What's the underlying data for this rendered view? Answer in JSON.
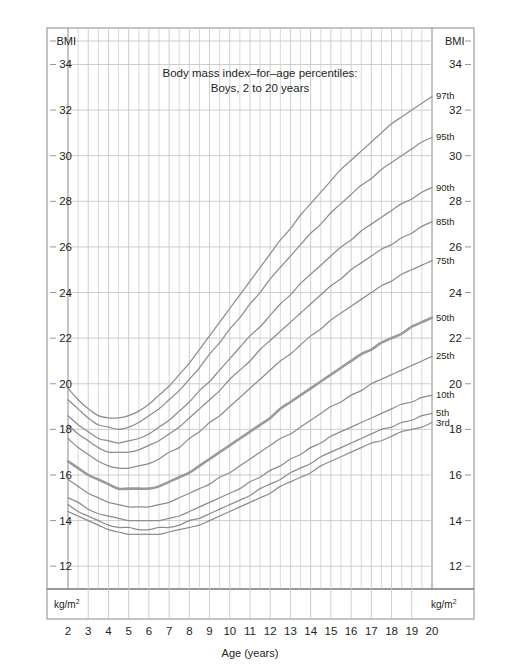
{
  "chart_data": {
    "type": "line",
    "title": "Body mass index–for–age percentiles:",
    "subtitle": "Boys, 2 to 20 years",
    "xlabel": "Age (years)",
    "ylabel": "BMI",
    "unit": "kg/m",
    "unit_sup": "2",
    "xlim": [
      2,
      20
    ],
    "ylim": [
      11,
      35.6
    ],
    "grid": true,
    "legend_position": "right-inline",
    "x_ticks": [
      2,
      3,
      4,
      5,
      6,
      7,
      8,
      9,
      10,
      11,
      12,
      13,
      14,
      15,
      16,
      17,
      18,
      19,
      20
    ],
    "x_minor_step": 0.5,
    "y_ticks": [
      12,
      14,
      16,
      18,
      20,
      22,
      24,
      26,
      28,
      30,
      32,
      34
    ],
    "y_axis_top_label": "BMI",
    "x": [
      2,
      2.5,
      3,
      3.5,
      4,
      4.5,
      5,
      5.5,
      6,
      6.5,
      7,
      7.5,
      8,
      8.5,
      9,
      9.5,
      10,
      10.5,
      11,
      11.5,
      12,
      12.5,
      13,
      13.5,
      14,
      14.5,
      15,
      15.5,
      16,
      16.5,
      17,
      17.5,
      18,
      18.5,
      19,
      19.5,
      20
    ],
    "series": [
      {
        "name": "97th",
        "label": "97th",
        "bold": false,
        "values": [
          19.8,
          19.3,
          18.9,
          18.6,
          18.5,
          18.5,
          18.6,
          18.8,
          19.1,
          19.5,
          19.9,
          20.4,
          20.9,
          21.5,
          22.1,
          22.7,
          23.3,
          23.9,
          24.5,
          25.1,
          25.7,
          26.3,
          26.8,
          27.4,
          27.9,
          28.4,
          28.9,
          29.4,
          29.8,
          30.2,
          30.6,
          31.0,
          31.4,
          31.7,
          32.0,
          32.3,
          32.6
        ]
      },
      {
        "name": "95th",
        "label": "95th",
        "bold": false,
        "values": [
          19.3,
          18.9,
          18.5,
          18.2,
          18.1,
          18.0,
          18.1,
          18.3,
          18.6,
          18.9,
          19.3,
          19.7,
          20.2,
          20.7,
          21.3,
          21.8,
          22.4,
          22.9,
          23.5,
          24.0,
          24.6,
          25.1,
          25.6,
          26.1,
          26.6,
          27.0,
          27.5,
          27.9,
          28.3,
          28.7,
          29.0,
          29.4,
          29.7,
          30.0,
          30.3,
          30.6,
          30.8
        ]
      },
      {
        "name": "90th",
        "label": "90th",
        "bold": false,
        "values": [
          18.6,
          18.2,
          17.9,
          17.6,
          17.5,
          17.4,
          17.5,
          17.6,
          17.8,
          18.1,
          18.4,
          18.8,
          19.2,
          19.7,
          20.1,
          20.6,
          21.1,
          21.6,
          22.1,
          22.5,
          23.0,
          23.5,
          23.9,
          24.4,
          24.8,
          25.2,
          25.6,
          26.0,
          26.3,
          26.7,
          27.0,
          27.3,
          27.6,
          27.9,
          28.1,
          28.4,
          28.6
        ]
      },
      {
        "name": "85th",
        "label": "85th",
        "bold": false,
        "values": [
          18.2,
          17.8,
          17.5,
          17.2,
          17.0,
          17.0,
          17.0,
          17.1,
          17.3,
          17.5,
          17.8,
          18.1,
          18.5,
          18.9,
          19.3,
          19.7,
          20.2,
          20.6,
          21.0,
          21.5,
          21.9,
          22.3,
          22.7,
          23.1,
          23.5,
          23.9,
          24.3,
          24.6,
          25.0,
          25.3,
          25.6,
          25.9,
          26.1,
          26.4,
          26.6,
          26.9,
          27.1
        ]
      },
      {
        "name": "75th",
        "label": "75th",
        "bold": false,
        "values": [
          17.6,
          17.2,
          16.9,
          16.6,
          16.4,
          16.3,
          16.3,
          16.4,
          16.5,
          16.7,
          17.0,
          17.2,
          17.6,
          17.9,
          18.3,
          18.6,
          19.0,
          19.4,
          19.8,
          20.2,
          20.6,
          21.0,
          21.3,
          21.7,
          22.1,
          22.4,
          22.8,
          23.1,
          23.4,
          23.7,
          24.0,
          24.3,
          24.5,
          24.8,
          25.0,
          25.2,
          25.4
        ]
      },
      {
        "name": "50th",
        "label": "50th",
        "bold": true,
        "values": [
          16.6,
          16.3,
          16.0,
          15.8,
          15.6,
          15.4,
          15.4,
          15.4,
          15.4,
          15.5,
          15.7,
          15.9,
          16.1,
          16.4,
          16.7,
          17.0,
          17.3,
          17.6,
          17.9,
          18.2,
          18.5,
          18.9,
          19.2,
          19.5,
          19.8,
          20.1,
          20.4,
          20.7,
          21.0,
          21.3,
          21.5,
          21.8,
          22.0,
          22.2,
          22.5,
          22.7,
          22.9
        ]
      },
      {
        "name": "25th",
        "label": "25th",
        "bold": false,
        "values": [
          15.8,
          15.5,
          15.2,
          15.0,
          14.8,
          14.7,
          14.6,
          14.6,
          14.6,
          14.7,
          14.8,
          15.0,
          15.2,
          15.4,
          15.6,
          15.9,
          16.1,
          16.4,
          16.7,
          17.0,
          17.3,
          17.6,
          17.8,
          18.1,
          18.4,
          18.7,
          19.0,
          19.2,
          19.5,
          19.7,
          20.0,
          20.2,
          20.4,
          20.6,
          20.8,
          21.0,
          21.2
        ]
      },
      {
        "name": "10th",
        "label": "10th",
        "bold": false,
        "values": [
          15.0,
          14.8,
          14.5,
          14.3,
          14.2,
          14.1,
          14.0,
          14.0,
          14.0,
          14.0,
          14.1,
          14.2,
          14.4,
          14.6,
          14.8,
          15.0,
          15.2,
          15.4,
          15.7,
          15.9,
          16.2,
          16.4,
          16.7,
          16.9,
          17.2,
          17.4,
          17.7,
          17.9,
          18.1,
          18.3,
          18.5,
          18.7,
          18.9,
          19.1,
          19.2,
          19.4,
          19.5
        ]
      },
      {
        "name": "5th",
        "label": "5th",
        "bold": false,
        "values": [
          14.7,
          14.4,
          14.2,
          14.0,
          13.8,
          13.7,
          13.7,
          13.6,
          13.6,
          13.7,
          13.7,
          13.8,
          14.0,
          14.1,
          14.3,
          14.5,
          14.7,
          14.9,
          15.1,
          15.4,
          15.6,
          15.8,
          16.1,
          16.3,
          16.5,
          16.8,
          17.0,
          17.2,
          17.4,
          17.6,
          17.8,
          18.0,
          18.1,
          18.3,
          18.4,
          18.6,
          18.7
        ]
      },
      {
        "name": "3rd",
        "label": "3rd",
        "bold": false,
        "values": [
          14.4,
          14.2,
          14.0,
          13.8,
          13.6,
          13.5,
          13.4,
          13.4,
          13.4,
          13.4,
          13.5,
          13.6,
          13.7,
          13.8,
          14.0,
          14.2,
          14.4,
          14.6,
          14.8,
          15.0,
          15.2,
          15.5,
          15.7,
          15.9,
          16.1,
          16.4,
          16.6,
          16.8,
          17.0,
          17.2,
          17.4,
          17.5,
          17.7,
          17.9,
          18.0,
          18.1,
          18.3
        ]
      }
    ]
  },
  "style": {
    "curve_color": "#8d8d8d",
    "curve_bold_color": "#9a9a9a",
    "grid_color": "#c8c8c8",
    "frame_color": "#8a8a8a",
    "text_color": "#231f20",
    "background": "#ffffff"
  }
}
